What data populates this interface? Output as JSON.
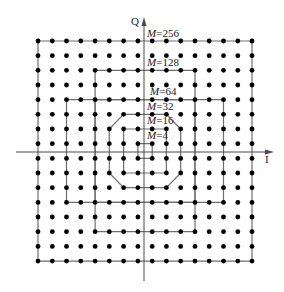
{
  "diagram": {
    "axes": {
      "horizontal_label": "I",
      "vertical_label": "Q"
    },
    "grid": {
      "columns": 16,
      "rows": 16,
      "total_points": 256
    },
    "colors": {
      "dot": "#000000",
      "boundary": "#6e6e6e",
      "axis": "#4a4a4a"
    },
    "constellations": [
      {
        "id": "m256",
        "label_prefix": "M",
        "label_value": "=256",
        "shape": "square",
        "cols": [
          0,
          15
        ],
        "rows": [
          0,
          15
        ]
      },
      {
        "id": "m128",
        "label_prefix": "M",
        "label_value": "=128",
        "shape": "cross",
        "cols": [
          2,
          13
        ],
        "rows": [
          2,
          13
        ],
        "cut": 2
      },
      {
        "id": "m64",
        "label_prefix": "M",
        "label_value": "=64",
        "shape": "square",
        "cols": [
          4,
          11
        ],
        "rows": [
          4,
          11
        ]
      },
      {
        "id": "m32",
        "label_prefix": "M",
        "label_value": "=32",
        "shape": "octagon",
        "cols": [
          5,
          10
        ],
        "rows": [
          5,
          10
        ],
        "cut": 1
      },
      {
        "id": "m16",
        "label_prefix": "M",
        "label_value": "=16",
        "shape": "square",
        "cols": [
          6,
          9
        ],
        "rows": [
          6,
          9
        ]
      },
      {
        "id": "m4",
        "label_prefix": "M",
        "label_value": "=4",
        "shape": "square",
        "cols": [
          7,
          8
        ],
        "rows": [
          7,
          8
        ]
      }
    ]
  }
}
